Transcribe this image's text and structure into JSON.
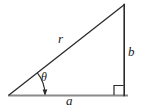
{
  "figure": {
    "name": "right-triangle-polar-coordinates",
    "background_color": "#ffffff",
    "stroke_color": "#2b2b2b",
    "baseline_color": "#808080",
    "labels": {
      "hypotenuse": "r",
      "opposite": "b",
      "adjacent": "a",
      "angle": "θ"
    },
    "geometry": {
      "left_vertex": [
        9,
        95
      ],
      "right_vertex": [
        124,
        95
      ],
      "apex": [
        124,
        5
      ],
      "right_angle_marker": {
        "x": 114,
        "y": 85,
        "size": 10
      },
      "angle_arc": {
        "center": [
          9,
          95
        ],
        "radius": 36,
        "start_deg": 0,
        "end_deg": 38
      }
    }
  }
}
